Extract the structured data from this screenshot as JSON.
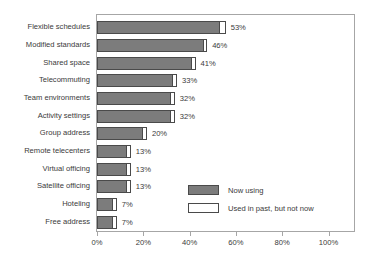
{
  "chart_data": {
    "type": "bar",
    "orientation": "horizontal",
    "stacked": true,
    "title": "",
    "xlabel": "",
    "ylabel": "",
    "xlim": [
      0,
      111
    ],
    "xticks": [
      "0%",
      "20%",
      "40%",
      "60%",
      "80%",
      "100%"
    ],
    "xtick_values": [
      0,
      20,
      40,
      60,
      80,
      100
    ],
    "grid": false,
    "legend_position": "inside-lower-right",
    "categories": [
      "Flexible schedules",
      "Modified standards",
      "Shared space",
      "Telecommuting",
      "Team environments",
      "Activity settings",
      "Group address",
      "Remote telecenters",
      "Virtual officing",
      "Satellite officing",
      "Hoteling",
      "Free address"
    ],
    "series": [
      {
        "name": "Now using",
        "color": "#7c7c7c",
        "values": [
          53,
          46,
          41,
          33,
          32,
          32,
          20,
          13,
          13,
          13,
          7,
          7
        ]
      },
      {
        "name": "Used in past, but not now",
        "color": "#ffffff",
        "values": [
          3,
          2,
          2,
          2,
          2,
          2,
          2,
          2,
          2,
          2,
          2,
          2
        ]
      }
    ],
    "data_labels": [
      "53%",
      "46%",
      "41%",
      "33%",
      "32%",
      "32%",
      "20%",
      "13%",
      "13%",
      "13%",
      "7%",
      "7%"
    ],
    "legend": [
      {
        "label": "Now using",
        "swatch": "now"
      },
      {
        "label": "Used in past, but not now",
        "swatch": "past"
      }
    ]
  }
}
